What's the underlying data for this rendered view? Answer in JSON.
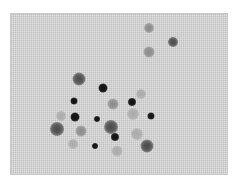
{
  "caption": {
    "text": "· · · · · · · · · · ·"
  },
  "photo": {
    "description": "Grayscale micrograph of stained cells/spots on a mesh-textured background",
    "background_color": "#d3d3d3",
    "spots": [
      {
        "x": 138,
        "y": 14,
        "size": 10,
        "tone": "light"
      },
      {
        "x": 162,
        "y": 28,
        "size": 10,
        "tone": "mid"
      },
      {
        "x": 138,
        "y": 38,
        "size": 11,
        "tone": "light"
      },
      {
        "x": 68,
        "y": 65,
        "size": 13,
        "tone": "mid"
      },
      {
        "x": 92,
        "y": 74,
        "size": 9,
        "tone": "dark"
      },
      {
        "x": 63,
        "y": 87,
        "size": 7,
        "tone": "dark"
      },
      {
        "x": 121,
        "y": 88,
        "size": 8,
        "tone": "dark"
      },
      {
        "x": 102,
        "y": 90,
        "size": 11,
        "tone": "light"
      },
      {
        "x": 130,
        "y": 80,
        "size": 10,
        "tone": "faint"
      },
      {
        "x": 64,
        "y": 103,
        "size": 9,
        "tone": "dark"
      },
      {
        "x": 86,
        "y": 105,
        "size": 6,
        "tone": "dark"
      },
      {
        "x": 140,
        "y": 102,
        "size": 7,
        "tone": "dark"
      },
      {
        "x": 50,
        "y": 102,
        "size": 10,
        "tone": "faint"
      },
      {
        "x": 122,
        "y": 100,
        "size": 12,
        "tone": "faint"
      },
      {
        "x": 46,
        "y": 115,
        "size": 14,
        "tone": "mid"
      },
      {
        "x": 70,
        "y": 117,
        "size": 11,
        "tone": "light"
      },
      {
        "x": 100,
        "y": 113,
        "size": 14,
        "tone": "mid"
      },
      {
        "x": 104,
        "y": 123,
        "size": 8,
        "tone": "dark"
      },
      {
        "x": 84,
        "y": 132,
        "size": 6,
        "tone": "dark"
      },
      {
        "x": 136,
        "y": 132,
        "size": 13,
        "tone": "mid"
      },
      {
        "x": 106,
        "y": 137,
        "size": 11,
        "tone": "faint"
      },
      {
        "x": 62,
        "y": 130,
        "size": 10,
        "tone": "faint"
      },
      {
        "x": 126,
        "y": 120,
        "size": 12,
        "tone": "faint"
      }
    ]
  }
}
